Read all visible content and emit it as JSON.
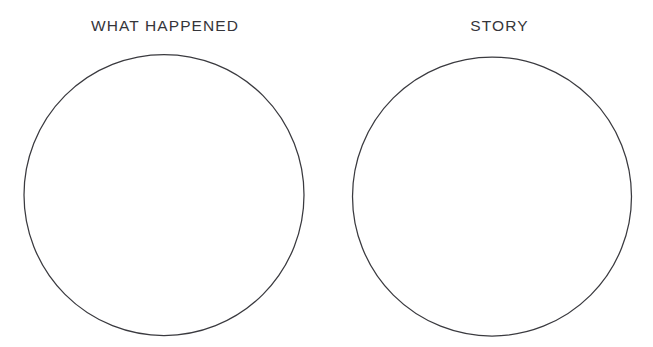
{
  "page": {
    "background_color": "#ffffff",
    "width": 653,
    "height": 347
  },
  "diagram": {
    "type": "two-circle-worksheet",
    "stroke_color": "#3a3a3f",
    "text_color": "#35353a",
    "regions": [
      {
        "key": "what_happened",
        "label": "WHAT HAPPENED",
        "shape": "ellipse",
        "center_x": 164,
        "center_y": 195,
        "radius_x": 140,
        "radius_y": 140,
        "content": ""
      },
      {
        "key": "story",
        "label": "STORY",
        "shape": "ellipse",
        "center_x": 492,
        "center_y": 196,
        "radius_x": 139,
        "radius_y": 139,
        "content": ""
      }
    ]
  }
}
